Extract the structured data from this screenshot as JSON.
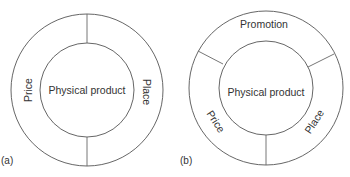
{
  "figure": {
    "panels": [
      {
        "id": "a",
        "panel_label": "(a)",
        "center_label": "Physical product",
        "segments": [
          {
            "label": "Price",
            "position": "left"
          },
          {
            "label": "Place",
            "position": "right"
          }
        ]
      },
      {
        "id": "b",
        "panel_label": "(b)",
        "center_label": "Physical product",
        "segments": [
          {
            "label": "Promotion",
            "position": "top"
          },
          {
            "label": "Price",
            "position": "lower-left"
          },
          {
            "label": "Place",
            "position": "lower-right"
          }
        ]
      }
    ],
    "colors": {
      "stroke": "#555555",
      "text": "#333333",
      "background": "#ffffff"
    }
  }
}
